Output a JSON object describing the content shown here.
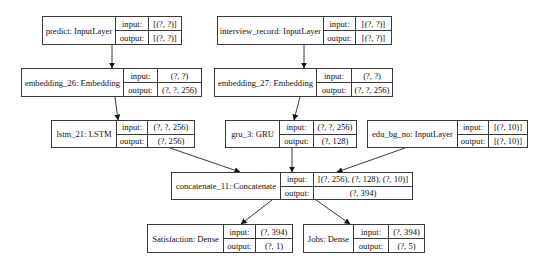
{
  "diagram": {
    "type": "keras-model-plot",
    "colors": {
      "line": "#3a3a3a",
      "background": "#ffffff",
      "text": "#111111"
    },
    "port_labels": {
      "input": "input:",
      "output": "output:"
    },
    "nodes": [
      {
        "id": "predict",
        "name": "predict: InputLayer",
        "input": "[(?, ?)]",
        "output": "[(?, ?)]",
        "box": [
          42,
          16,
          182,
          45
        ],
        "div": [
          115,
          148
        ]
      },
      {
        "id": "interview_record",
        "name": "interview_record: InputLayer",
        "input": "[(?, ?)]",
        "output": "[(?, ?)]",
        "box": [
          217,
          16,
          392,
          45
        ],
        "div": [
          323,
          355
        ]
      },
      {
        "id": "embedding_26",
        "name": "embedding_26: Embedding",
        "input": "(?, ?)",
        "output": "(?, ?, 256)",
        "box": [
          21,
          68,
          202,
          97
        ],
        "div": [
          123,
          157
        ]
      },
      {
        "id": "embedding_27",
        "name": "embedding_27: Embedding",
        "input": "(?, ?)",
        "output": "(?, ?, 256)",
        "box": [
          214,
          68,
          393,
          97
        ],
        "div": [
          316,
          351
        ]
      },
      {
        "id": "lstm_21",
        "name": "lstm_21: LSTM",
        "input": "(?, ?, 256)",
        "output": "(?, 256)",
        "box": [
          51,
          120,
          195,
          148
        ],
        "div": [
          116,
          147
        ]
      },
      {
        "id": "gru_3",
        "name": "gru_3: GRU",
        "input": "(?, ?, 256)",
        "output": "(?, 128)",
        "box": [
          225,
          120,
          357,
          148
        ],
        "div": [
          279,
          313
        ]
      },
      {
        "id": "edu_bg_no",
        "name": "edu_bg_no: InputLayer",
        "input": "[(?, 10)]",
        "output": "[(?, 10)]",
        "box": [
          367,
          120,
          528,
          148
        ],
        "div": [
          457,
          488
        ]
      },
      {
        "id": "concatenate_11",
        "name": "concatenate_11: Concatenate",
        "input": "[(?, 256), (?, 128), (?, 10)]",
        "output": "(?, 394)",
        "box": [
          171,
          172,
          413,
          200
        ],
        "div": [
          280,
          313
        ]
      },
      {
        "id": "satisfaction",
        "name": "Satisfaction: Dense",
        "input": "(?, 394)",
        "output": "(?, 1)",
        "box": [
          147,
          224,
          293,
          253
        ],
        "div": [
          223,
          255
        ]
      },
      {
        "id": "jobs",
        "name": "Jobs: Dense",
        "input": "(?, 394)",
        "output": "(?, 5)",
        "box": [
          303,
          224,
          425,
          253
        ],
        "div": [
          353,
          388
        ]
      }
    ],
    "edges": [
      {
        "from": "predict",
        "to": "embedding_26",
        "pts": [
          112,
          45,
          112,
          68
        ]
      },
      {
        "from": "interview_record",
        "to": "embedding_27",
        "pts": [
          304,
          45,
          304,
          68
        ]
      },
      {
        "from": "embedding_26",
        "to": "lstm_21",
        "pts": [
          115,
          97,
          118,
          120
        ]
      },
      {
        "from": "embedding_27",
        "to": "gru_3",
        "pts": [
          300,
          97,
          294,
          120
        ]
      },
      {
        "from": "lstm_21",
        "to": "concatenate_11",
        "pts": [
          170,
          148,
          240,
          172
        ]
      },
      {
        "from": "gru_3",
        "to": "concatenate_11",
        "pts": [
          292,
          148,
          292,
          172
        ]
      },
      {
        "from": "edu_bg_no",
        "to": "concatenate_11",
        "pts": [
          405,
          148,
          337,
          172
        ]
      },
      {
        "from": "concatenate_11",
        "to": "satisfaction",
        "pts": [
          272,
          200,
          241,
          224
        ]
      },
      {
        "from": "concatenate_11",
        "to": "jobs",
        "pts": [
          316,
          200,
          350,
          224
        ]
      }
    ]
  }
}
